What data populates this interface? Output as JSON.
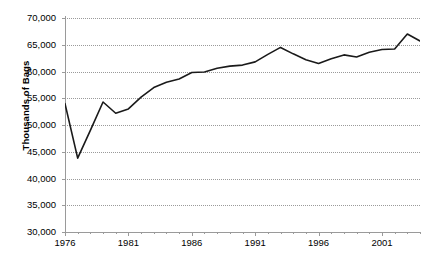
{
  "chart_data": {
    "type": "line",
    "title": "",
    "xlabel": "",
    "ylabel": "Thousands of Bags",
    "ylim": [
      30000,
      70000
    ],
    "xlim": [
      1976,
      2004
    ],
    "ytick_labels": [
      "70,000",
      "65,000",
      "60,000",
      "55,000",
      "50,000",
      "45,000",
      "40,000",
      "35,000",
      "30,000"
    ],
    "ytick_values": [
      70000,
      65000,
      60000,
      55000,
      50000,
      45000,
      40000,
      35000,
      30000
    ],
    "xtick_labels": [
      "1976",
      "1981",
      "1986",
      "1991",
      "1996",
      "2001"
    ],
    "xtick_values": [
      1976,
      1981,
      1986,
      1991,
      1996,
      2001
    ],
    "minor_xtick_interval": 1,
    "grid": "horizontal-dotted",
    "legend": "none",
    "line_color": "#1a1a1a",
    "grid_color": "#9a9a9a",
    "axis_color": "#9a9a9a",
    "background_color": "#ffffff",
    "x": [
      1976,
      1977,
      1978,
      1979,
      1980,
      1981,
      1982,
      1983,
      1984,
      1985,
      1986,
      1987,
      1988,
      1989,
      1990,
      1991,
      1992,
      1993,
      1994,
      1995,
      1996,
      1997,
      1998,
      1999,
      2000,
      2001,
      2002,
      2003,
      2004
    ],
    "values": [
      54000,
      43800,
      49000,
      54300,
      52200,
      53000,
      55200,
      57000,
      58000,
      58600,
      59800,
      59900,
      60600,
      61000,
      61200,
      61800,
      63200,
      64500,
      63300,
      62200,
      61500,
      62400,
      63100,
      62700,
      63600,
      64100,
      64200,
      67000,
      65700
    ],
    "series": [
      {
        "name": "Thousands of Bags",
        "values": [
          54000,
          43800,
          49000,
          54300,
          52200,
          53000,
          55200,
          57000,
          58000,
          58600,
          59800,
          59900,
          60600,
          61000,
          61200,
          61800,
          63200,
          64500,
          63300,
          62200,
          61500,
          62400,
          63100,
          62700,
          63600,
          64100,
          64200,
          67000,
          65700
        ]
      }
    ]
  }
}
